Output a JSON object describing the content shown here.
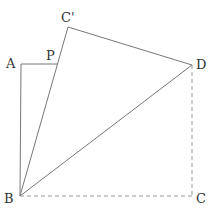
{
  "diagram": {
    "colors": {
      "line": "#777777",
      "dashed": "#999999",
      "label": "#333333"
    },
    "points": {
      "A": {
        "label": "A",
        "x": 21,
        "y": 64
      },
      "P": {
        "label": "P",
        "x": 57,
        "y": 64
      },
      "C_prime": {
        "label": "C'",
        "x": 68,
        "y": 27
      },
      "D": {
        "label": "D",
        "x": 192,
        "y": 65
      },
      "B": {
        "label": "B",
        "x": 20,
        "y": 196
      },
      "C": {
        "label": "C",
        "x": 192,
        "y": 196
      }
    },
    "segments_solid": [
      "AB",
      "AP",
      "BC'",
      "C'D",
      "BD"
    ],
    "segments_dashed": [
      "BC",
      "DC"
    ]
  }
}
